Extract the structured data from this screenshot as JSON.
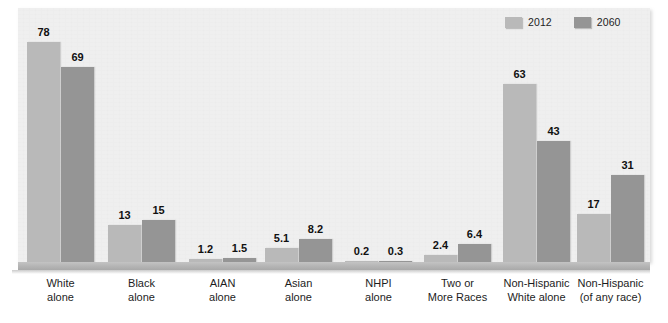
{
  "chart_data": {
    "type": "bar",
    "title": "",
    "subtitle": "",
    "xlabel": "",
    "ylabel": "",
    "ylim": [
      0,
      80
    ],
    "grid": false,
    "legend_position": "top-right",
    "categories": [
      "White\nalone",
      "Black\nalone",
      "AIAN\nalone",
      "Asian\nalone",
      "NHPI\nalone",
      "Two or\nMore Races",
      "Non-Hispanic\nWhite alone",
      "Non-Hispanic\n(of any race)"
    ],
    "category_lines": [
      [
        "White",
        "alone"
      ],
      [
        "Black",
        "alone"
      ],
      [
        "AIAN",
        "alone"
      ],
      [
        "Asian",
        "alone"
      ],
      [
        "NHPI",
        "alone"
      ],
      [
        "Two or",
        "More Races"
      ],
      [
        "Non-Hispanic",
        "White alone"
      ],
      [
        "Non-Hispanic",
        "(of any race)"
      ]
    ],
    "series": [
      {
        "name": "2012",
        "color": "#b9b9b9",
        "values": [
          78,
          13,
          1.2,
          5.1,
          0.2,
          2.4,
          63,
          17
        ],
        "labels": [
          "78",
          "13",
          "1.2",
          "5.1",
          "0.2",
          "2.4",
          "63",
          "17"
        ]
      },
      {
        "name": "2060",
        "color": "#959595",
        "values": [
          69,
          15,
          1.5,
          8.2,
          0.3,
          6.4,
          43,
          31
        ],
        "labels": [
          "69",
          "15",
          "1.5",
          "8.2",
          "0.3",
          "6.4",
          "43",
          "31"
        ]
      }
    ]
  },
  "legend": {
    "items": [
      {
        "label": "2012",
        "color": "#b9b9b9"
      },
      {
        "label": "2060",
        "color": "#959595"
      }
    ]
  },
  "colors": {
    "series_2012": "#b9b9b9",
    "series_2060": "#959595",
    "plot_background": "#efefef",
    "page_background": "#ffffff",
    "axis_baseline": "#b4b4b4",
    "text": "#1d1d1d",
    "value_label": "#111111"
  }
}
